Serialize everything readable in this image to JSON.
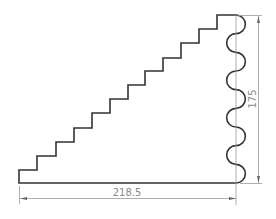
{
  "drawing": {
    "type": "technical-drawing",
    "shape": "staircase-profile-with-wavy-edge",
    "stroke_color": "#333333",
    "dimension_color": "#8a8a8a",
    "steps": 12,
    "wave_arcs": 9
  },
  "dimensions": {
    "width": {
      "label": "218.5"
    },
    "height": {
      "label": "175"
    }
  }
}
